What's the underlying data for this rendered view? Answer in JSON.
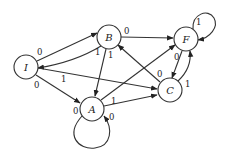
{
  "diagram": {
    "type": "state-transition-graph",
    "nodes": [
      {
        "id": "I",
        "label": "I",
        "x": 26,
        "y": 67
      },
      {
        "id": "B",
        "label": "B",
        "x": 109,
        "y": 37
      },
      {
        "id": "F",
        "label": "F",
        "x": 186,
        "y": 39
      },
      {
        "id": "A",
        "label": "A",
        "x": 92,
        "y": 109
      },
      {
        "id": "C",
        "label": "C",
        "x": 170,
        "y": 90
      }
    ],
    "edges": [
      {
        "from": "I",
        "to": "B",
        "label": "0"
      },
      {
        "from": "B",
        "to": "I",
        "label": "1"
      },
      {
        "from": "I",
        "to": "A",
        "label": "0"
      },
      {
        "from": "I",
        "to": "C",
        "label": "1"
      },
      {
        "from": "B",
        "to": "F",
        "label": "0"
      },
      {
        "from": "B",
        "to": "A",
        "label": "1"
      },
      {
        "from": "A",
        "to": "C",
        "label": "1"
      },
      {
        "from": "A",
        "to": "F",
        "label": ""
      },
      {
        "from": "A",
        "to": "A",
        "label": "0",
        "label2": "0"
      },
      {
        "from": "C",
        "to": "B",
        "label": "0"
      },
      {
        "from": "F",
        "to": "C",
        "label": "0"
      },
      {
        "from": "C",
        "to": "F",
        "label": "1"
      },
      {
        "from": "F",
        "to": "F",
        "label": "1"
      }
    ]
  }
}
